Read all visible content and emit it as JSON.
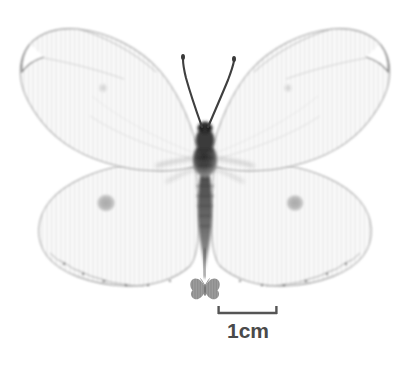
{
  "figure": {
    "kind": "natural-history-specimen-photograph",
    "background_color": "#ffffff"
  },
  "scale_bar": {
    "label": "1cm",
    "label_color": "#4a4a4a",
    "bar_color": "#555555",
    "x_start_px": 218,
    "x_end_px": 277,
    "y_px": 313,
    "tick_height_px": 9
  },
  "silhouette_icon": {
    "name": "butterfly-silhouette-icon",
    "color": "#9a9a9a",
    "center_x_px": 205,
    "center_y_px": 289,
    "width_px": 30,
    "height_px": 22
  },
  "specimen": {
    "body_color": "#3a3a3a",
    "wing_fill": "#fbfbfb",
    "wing_edge": "#9c9c9c",
    "stripe_color": "#ececec",
    "hindwing_spot_color": "#b4b4b4",
    "forewing_spot_color": "#dedede",
    "antenna_color": "#3f3f3f",
    "center_x_px": 205,
    "forewing_spot_left": {
      "x": 103,
      "y": 88
    },
    "forewing_spot_right": {
      "x": 288,
      "y": 88
    },
    "hindwing_spot_left": {
      "x": 106,
      "y": 203
    },
    "hindwing_spot_right": {
      "x": 295,
      "y": 203
    }
  }
}
